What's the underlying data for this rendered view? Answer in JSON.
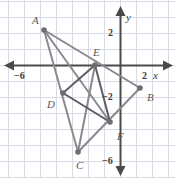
{
  "figure": {
    "name": "coordinate-plane-triangle-midsegment-figure",
    "width": 175,
    "height": 178,
    "background": "#ffffff",
    "grid": {
      "visible": true,
      "unit_px": 16,
      "origin_px": {
        "x": 120,
        "y": 65
      },
      "color": "#d8dbe6",
      "x_range": [
        -7.5,
        3.4
      ],
      "y_range": [
        -7.1,
        3.3
      ]
    },
    "axes": {
      "color": "#4a4a4c",
      "x_axis": {
        "label": "x",
        "arrow_left": true,
        "arrow_right": true
      },
      "y_axis": {
        "label": "y",
        "arrow_up": true,
        "arrow_down": true
      }
    },
    "tick_labels": [
      {
        "text": "−6",
        "axis": "x",
        "value": -6
      },
      {
        "text": "2",
        "axis": "x",
        "value": 2
      },
      {
        "text": "2",
        "axis": "y",
        "value": 2
      },
      {
        "text": "−2",
        "axis": "y",
        "value": -2
      },
      {
        "text": "−6",
        "axis": "y",
        "value": -6
      }
    ]
  },
  "chart_data": {
    "type": "scatter",
    "title": "",
    "xlabel": "x",
    "ylabel": "y",
    "xlim": [
      -7.5,
      3.4
    ],
    "ylim": [
      -7.1,
      3.3
    ],
    "grid": true,
    "legend": "none",
    "points": [
      {
        "label": "A",
        "x": -4.75,
        "y": 2.2,
        "px": 44,
        "py": 30,
        "label_px": 32,
        "label_py": 15
      },
      {
        "label": "B",
        "x": 1.25,
        "y": -1.4,
        "px": 140,
        "py": 88,
        "label_px": 147,
        "label_py": 92
      },
      {
        "label": "C",
        "x": -2.6,
        "y": -5.4,
        "px": 78,
        "py": 152,
        "label_px": 76,
        "label_py": 160
      },
      {
        "label": "D",
        "x": -3.55,
        "y": -1.75,
        "px": 63,
        "py": 93,
        "label_px": 47,
        "label_py": 99
      },
      {
        "label": "E",
        "x": -1.55,
        "y": 0,
        "px": 95,
        "py": 65,
        "label_px": 93,
        "label_py": 47
      },
      {
        "label": "F",
        "x": -0.6,
        "y": -3.55,
        "px": 110,
        "py": 122,
        "label_px": 117,
        "label_py": 131
      }
    ],
    "outer_triangle": {
      "name": "triangle-ABC",
      "vertices": [
        "A",
        "B",
        "C"
      ],
      "stroke": "#8a8a8e",
      "stroke_width": 2
    },
    "inner_quadrilateral": {
      "name": "quadrilateral-DEFD",
      "vertices": [
        "D",
        "E",
        "F"
      ],
      "stroke": "#5e5e62",
      "stroke_width": 2,
      "segments": [
        [
          "D",
          "E"
        ],
        [
          "E",
          "F"
        ],
        [
          "F",
          "D"
        ]
      ]
    },
    "cevians": {
      "stroke": "#8a8a8e",
      "stroke_width": 2,
      "segments": [
        [
          "A",
          "F"
        ],
        [
          "C",
          "E"
        ]
      ]
    }
  }
}
